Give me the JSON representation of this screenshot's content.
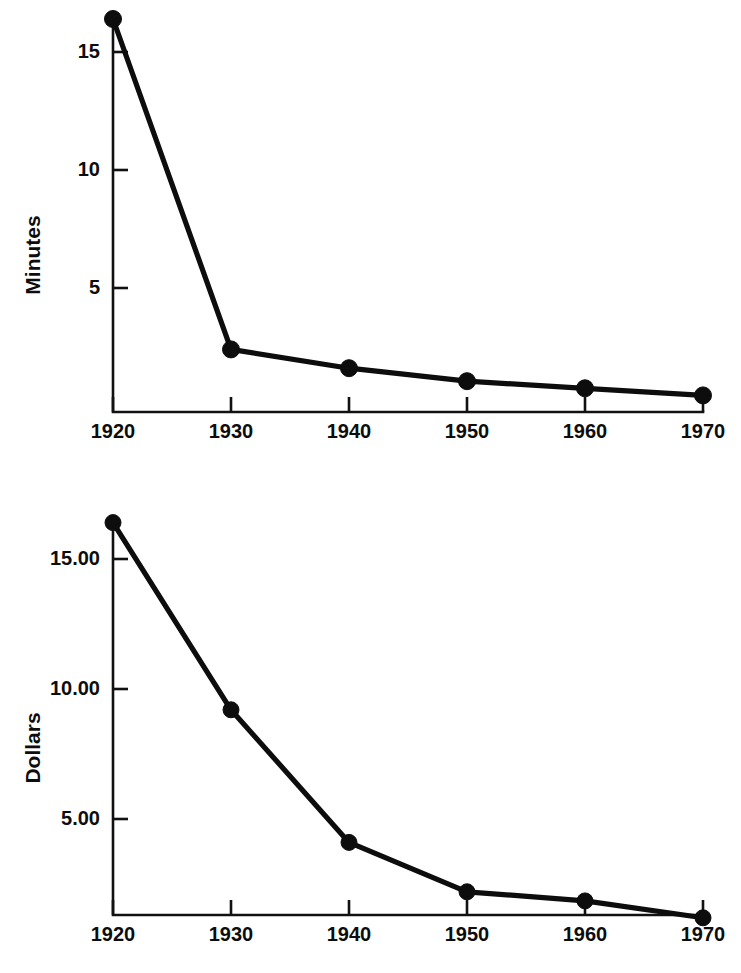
{
  "figure": {
    "background_color": "#ffffff",
    "ink_color": "#0d0d0d",
    "width": 741,
    "height": 973
  },
  "chart_data": [
    {
      "type": "line",
      "title": "",
      "subtitle": "",
      "xlabel": "",
      "ylabel": "Minutes",
      "x": [
        1920,
        1930,
        1940,
        1950,
        1960,
        1970
      ],
      "categories": [
        "1920",
        "1930",
        "1940",
        "1950",
        "1960",
        "1970"
      ],
      "values": [
        16.4,
        2.4,
        1.6,
        1.05,
        0.75,
        0.45
      ],
      "series": [
        {
          "name": "Minutes",
          "values": [
            16.4,
            2.4,
            1.6,
            1.05,
            0.75,
            0.45
          ]
        }
      ],
      "xtick_labels": [
        "1920",
        "1930",
        "1940",
        "1950",
        "1960",
        "1970"
      ],
      "ytick_values": [
        5,
        10,
        15
      ],
      "ytick_labels": [
        "5",
        "10",
        "15"
      ],
      "xlim": [
        1920,
        1970
      ],
      "ylim": [
        0,
        17.2
      ],
      "grid": false,
      "legend": false,
      "legend_position": "none",
      "markers": "filled-circle",
      "annotations": []
    },
    {
      "type": "line",
      "title": "",
      "subtitle": "",
      "xlabel": "",
      "ylabel": "Dollars",
      "x": [
        1920,
        1930,
        1940,
        1950,
        1960,
        1970
      ],
      "categories": [
        "1920",
        "1930",
        "1940",
        "1950",
        "1960",
        "1970"
      ],
      "values": [
        16.4,
        9.2,
        4.1,
        2.2,
        1.85,
        1.2
      ],
      "series": [
        {
          "name": "Dollars",
          "values": [
            16.4,
            9.2,
            4.1,
            2.2,
            1.85,
            1.2
          ]
        }
      ],
      "xtick_labels": [
        "1920",
        "1930",
        "1940",
        "1950",
        "1960",
        "1970"
      ],
      "ytick_values": [
        5,
        10,
        15
      ],
      "ytick_labels": [
        "5.00",
        "10.00",
        "15.00"
      ],
      "xlim": [
        1920,
        1970
      ],
      "ylim": [
        0,
        17.4
      ],
      "grid": false,
      "legend": false,
      "legend_position": "none",
      "markers": "filled-circle",
      "annotations": []
    }
  ],
  "panels": [
    {
      "id": "minutes-panel",
      "ylabel": "Minutes",
      "ytick_labels": [
        "15",
        "10",
        "5"
      ],
      "xtick_labels": [
        "1920",
        "1930",
        "1940",
        "1950",
        "1960",
        "1970"
      ]
    },
    {
      "id": "dollars-panel",
      "ylabel": "Dollars",
      "ytick_labels": [
        "15.00",
        "10.00",
        "5.00"
      ],
      "xtick_labels": [
        "1920",
        "1930",
        "1940",
        "1950",
        "1960",
        "1970"
      ]
    }
  ]
}
